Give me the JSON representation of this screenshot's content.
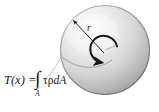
{
  "figure": {
    "background_color": "#ffffff",
    "equation": {
      "lhs": "T(x) =",
      "integral_sign": "∫",
      "integral_limit": "A",
      "integrand_tau": "τ",
      "integrand_rho": "ρ",
      "integrand_dA": "dA",
      "full_text": "T(x) = ∫A τρdA"
    },
    "labels": {
      "radius": "r"
    },
    "icons": {
      "radius_arrow": "radius-arrow-icon",
      "torque_arrow": "curved-torque-arrow-icon",
      "leader_line": "leader-line-icon",
      "area_element_arc": "area-element-arc-icon"
    },
    "colors": {
      "disk_light": "#f2f2f2",
      "disk_mid": "#d8d8d8",
      "disk_dark": "#9e9e9e",
      "outline": "#6f6f6f",
      "arrow": "#1a1a1a",
      "leader": "#b4b4b4",
      "text": "#171717"
    },
    "geometry": {
      "disk_center_x": 105,
      "disk_center_y": 50,
      "disk_radius": 45
    }
  }
}
